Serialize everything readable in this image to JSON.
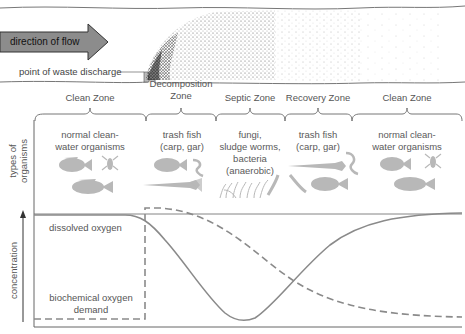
{
  "river": {
    "flow_label": "direction of flow",
    "discharge_label": "point of waste discharge",
    "arrow_color": "#8c8c8c"
  },
  "zones": [
    {
      "name": "Clean Zone",
      "organisms": "normal clean-\nwater organisms"
    },
    {
      "name": "Decomposition\nZone",
      "organisms": "trash fish\n(carp, gar)"
    },
    {
      "name": "Septic Zone",
      "organisms": "fungi,\nsludge worms,\nbacteria\n(anaerobic)"
    },
    {
      "name": "Recovery Zone",
      "organisms": "trash fish\n(carp, gar)"
    },
    {
      "name": "Clean Zone",
      "organisms": "normal clean-\nwater organisms"
    }
  ],
  "axes": {
    "organisms_label": "types of\norganisms",
    "concentration_label": "concentration"
  },
  "curves": {
    "dissolved_oxygen_label": "dissolved oxygen",
    "bod_label_line1": "biochemical oxygen",
    "bod_label_line2": "demand",
    "line_color": "#8a8a8a"
  }
}
